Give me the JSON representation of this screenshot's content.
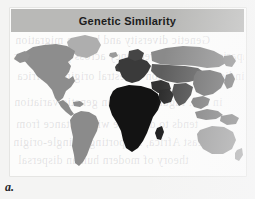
{
  "figure": {
    "title": "Genetic Similarity",
    "caption_label": "a.",
    "panel_background": "#fcfcfb",
    "page_background": "#f4f4f3",
    "title_bar_color": "#b9b9b7",
    "title_text_color": "#1c1c1c"
  },
  "ghost_text": {
    "note": "faint illegible show-through text from the reverse of the scanned page",
    "lines": [
      "Genetic diversity and human migration",
      "Comparison of allele frequency across populations",
      "indicates a common ancestral origin in Africa",
      "in full. Figure 4. Human genetic variation",
      "tends to decrease with distance from",
      "east Africa, supporting a single-origin",
      "theory of modern human dispersal"
    ]
  },
  "map": {
    "projection": "equirectangular",
    "ocean_color": "#fbfbfa",
    "legend_present": false,
    "legend_scale_note": "darker shading indicates greater genetic similarity",
    "regions": [
      {
        "name": "africa",
        "label": "Africa",
        "shade": "#131313",
        "similarity": "highest"
      },
      {
        "name": "madagascar",
        "label": "Madagascar",
        "shade": "#1b1b1b",
        "similarity": "highest"
      },
      {
        "name": "europe",
        "label": "Europe",
        "shade": "#3a3a3a",
        "similarity": "high"
      },
      {
        "name": "middle-east",
        "label": "Middle East",
        "shade": "#333333",
        "similarity": "high"
      },
      {
        "name": "south-asia",
        "label": "South Asia",
        "shade": "#4a4a4a",
        "similarity": "medium-high"
      },
      {
        "name": "east-asia",
        "label": "East Asia",
        "shade": "#6d6d6d",
        "similarity": "medium"
      },
      {
        "name": "siberia",
        "label": "Siberia",
        "shade": "#8a8a8a",
        "similarity": "medium-low"
      },
      {
        "name": "southeast-asia",
        "label": "Southeast Asia",
        "shade": "#767676",
        "similarity": "medium"
      },
      {
        "name": "north-america",
        "label": "North America",
        "shade": "#8d8d8d",
        "similarity": "medium-low"
      },
      {
        "name": "greenland",
        "label": "Greenland",
        "shade": "#aeaeae",
        "similarity": "low"
      },
      {
        "name": "south-america",
        "label": "South America",
        "shade": "#8b8b8b",
        "similarity": "medium-low"
      },
      {
        "name": "australia",
        "label": "Australia",
        "shade": "#9b9b9b",
        "similarity": "low"
      },
      {
        "name": "new-zealand",
        "label": "New Zealand",
        "shade": "#a4a4a4",
        "similarity": "low"
      },
      {
        "name": "new-guinea",
        "label": "New Guinea",
        "shade": "#7e7e7e",
        "similarity": "medium"
      },
      {
        "name": "japan",
        "label": "Japan",
        "shade": "#757575",
        "similarity": "medium"
      },
      {
        "name": "british-isles",
        "label": "British Isles",
        "shade": "#3f3f3f",
        "similarity": "high"
      },
      {
        "name": "iceland",
        "label": "Iceland",
        "shade": "#9a9a9a",
        "similarity": "low"
      },
      {
        "name": "central-america",
        "label": "Central America",
        "shade": "#8b8b8b",
        "similarity": "medium-low"
      },
      {
        "name": "caribbean",
        "label": "Caribbean",
        "shade": "#8f8f8f",
        "similarity": "medium-low"
      },
      {
        "name": "arabian-peninsula",
        "label": "Arabian Peninsula",
        "shade": "#2c2c2c",
        "similarity": "high"
      }
    ]
  }
}
